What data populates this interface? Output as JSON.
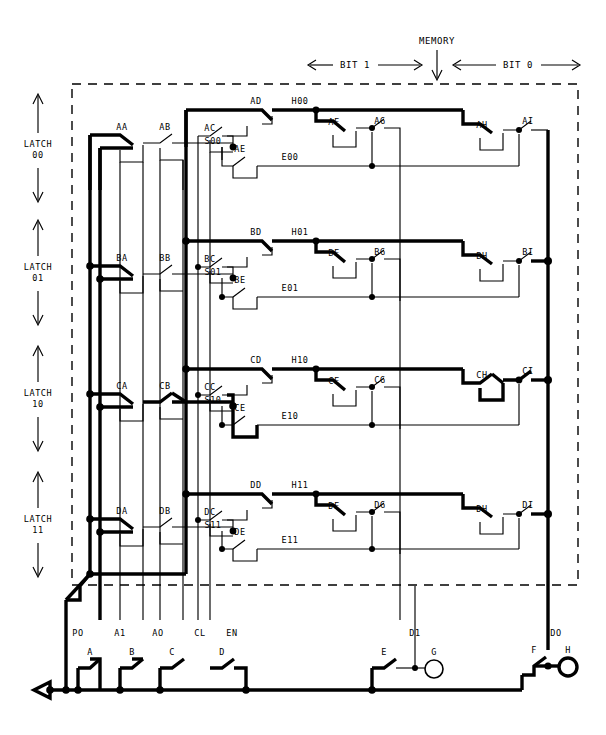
{
  "header": {
    "memory_label": "MEMORY",
    "bit1_label": "BIT 1",
    "bit0_label": "BIT 0"
  },
  "latches": [
    {
      "id": "00",
      "side_label_line1": "LATCH",
      "side_label_line2": "00",
      "relays": [
        "AA",
        "AB",
        "AC",
        "AD",
        "AE",
        "AF",
        "AG",
        "AH",
        "AI"
      ],
      "nodes": {
        "set": "S00",
        "hold": "H00",
        "erase": "E00"
      },
      "energized": false
    },
    {
      "id": "01",
      "side_label_line1": "LATCH",
      "side_label_line2": "01",
      "relays": [
        "BA",
        "BB",
        "BC",
        "BD",
        "BE",
        "BF",
        "BG",
        "BH",
        "BI"
      ],
      "nodes": {
        "set": "S01",
        "hold": "H01",
        "erase": "E01"
      },
      "energized": false
    },
    {
      "id": "10",
      "side_label_line1": "LATCH",
      "side_label_line2": "10",
      "relays": [
        "CA",
        "CB",
        "CC",
        "CD",
        "CE",
        "CF",
        "CG",
        "CH",
        "CI"
      ],
      "nodes": {
        "set": "S10",
        "hold": "H10",
        "erase": "E10"
      },
      "energized": true
    },
    {
      "id": "11",
      "side_label_line1": "LATCH",
      "side_label_line2": "11",
      "relays": [
        "DA",
        "DB",
        "DC",
        "DD",
        "DE",
        "DF",
        "DG",
        "DH",
        "DI"
      ],
      "nodes": {
        "set": "S11",
        "hold": "H11",
        "erase": "E11"
      },
      "energized": false
    }
  ],
  "buses": [
    {
      "name": "PO",
      "switch": "A",
      "closed": true
    },
    {
      "name": "A1",
      "switch": "B",
      "closed": true
    },
    {
      "name": "AO",
      "switch": "C",
      "closed": false
    },
    {
      "name": "CL",
      "switch": "D",
      "closed": false
    },
    {
      "name": "EN",
      "switch": null,
      "closed": false
    },
    {
      "name": "D1",
      "switch": "E",
      "closed": false
    },
    {
      "name": "DO",
      "switch": "F",
      "closed": true
    }
  ],
  "lamps": [
    {
      "name": "G",
      "bus": "D1",
      "lit": false
    },
    {
      "name": "H",
      "bus": "DO",
      "lit": true
    }
  ],
  "colors": {
    "ink": "#000000",
    "paper": "#ffffff"
  }
}
